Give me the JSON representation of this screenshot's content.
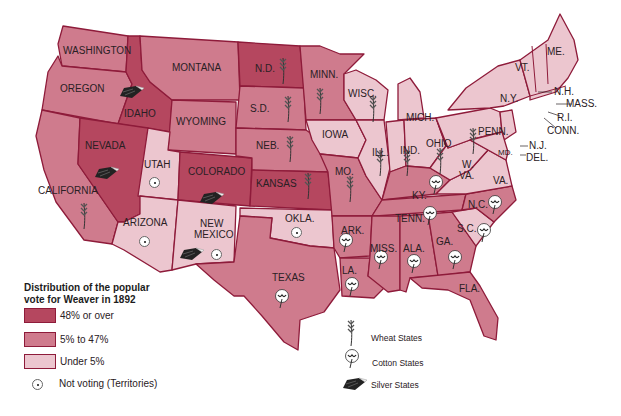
{
  "map_title": "Distribution of the popular vote for Weaver in 1892",
  "colors": {
    "high": "#b5475f",
    "mid": "#cf7b8d",
    "low": "#ecc6cf",
    "border": "#8e1b3a",
    "label": "#2a2024"
  },
  "legend": {
    "title_line1": "Distribution of the popular",
    "title_line2": "vote for Weaver in 1892",
    "items": [
      {
        "label": "48% or over",
        "color": "#b5475f"
      },
      {
        "label": "5% to 47%",
        "color": "#cf7b8d"
      },
      {
        "label": "Under 5%",
        "color": "#ecc6cf"
      },
      {
        "label": "Not voting (Territories)",
        "icon": "target-dot-icon"
      }
    ]
  },
  "symbol_legend": {
    "items": [
      {
        "label": "Wheat States",
        "icon": "wheat-icon"
      },
      {
        "label": "Cotton States",
        "icon": "cotton-icon"
      },
      {
        "label": "Silver States",
        "icon": "silver-ore-icon"
      }
    ]
  },
  "states": {
    "washington": "WASHINGTON",
    "oregon": "OREGON",
    "california": "CALIFORNIA",
    "idaho": "IDAHO",
    "nevada": "NEVADA",
    "montana": "MONTANA",
    "wyoming": "WYOMING",
    "utah": "UTAH",
    "colorado": "COLORADO",
    "arizona": "ARIZONA",
    "new_mexico_1": "NEW",
    "new_mexico_2": "MEXICO",
    "nd": "N.D.",
    "sd": "S.D.",
    "neb": "NEB.",
    "kansas": "KANSAS",
    "okla": "OKLA.",
    "texas": "TEXAS",
    "minn": "MINN.",
    "iowa": "IOWA",
    "mo": "MO.",
    "ark": "ARK.",
    "la": "LA.",
    "wisc": "WISC.",
    "ill": "ILL.",
    "mich": "MICH.",
    "ind": "IND.",
    "ohio": "OHIO",
    "ky": "KY.",
    "tenn": "TENN.",
    "miss": "MISS.",
    "ala": "ALA.",
    "ga": "GA.",
    "fla": "FLA.",
    "sc": "S.C.",
    "nc": "N.C.",
    "va": "VA.",
    "wva_1": "W.",
    "wva_2": "VA.",
    "penn": "PENN.",
    "ny": "N.Y.",
    "vt": "VT.",
    "me": "ME.",
    "nh": "N.H.",
    "mass": "MASS.",
    "ri": "R.I.",
    "conn": "CONN.",
    "nj": "N.J.",
    "del": "DEL.",
    "md": "MD."
  },
  "classification": {
    "48_or_over": [
      "Idaho",
      "Nevada",
      "Colorado",
      "Kansas",
      "North Dakota"
    ],
    "5_to_47": [
      "Washington",
      "Oregon",
      "California",
      "Montana",
      "Wyoming",
      "South Dakota",
      "Nebraska",
      "Minnesota",
      "Texas",
      "Missouri",
      "Arkansas",
      "Louisiana",
      "Mississippi",
      "Alabama",
      "Georgia",
      "Florida",
      "Tennessee",
      "Kentucky",
      "North Carolina"
    ],
    "under_5": [
      "Iowa",
      "Wisconsin",
      "Illinois",
      "Michigan",
      "Indiana",
      "Ohio",
      "Pennsylvania",
      "New York",
      "West Virginia",
      "Virginia",
      "South Carolina",
      "New England",
      "New Jersey",
      "Delaware",
      "Maryland"
    ],
    "not_voting": [
      "Utah",
      "Arizona",
      "New Mexico",
      "Oklahoma"
    ]
  }
}
